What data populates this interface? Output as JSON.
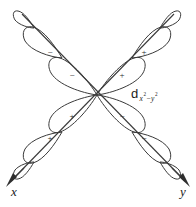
{
  "figure": {
    "type": "atomic-orbital-diagram",
    "background_color": "#ffffff",
    "stroke_color": "#3a3a3a",
    "text_color": "#1a1a1a",
    "width": 196,
    "height": 207,
    "center": {
      "x": 97,
      "y": 95
    }
  },
  "orbital_label": {
    "symbol": "d",
    "subscript_full": "x2-y2",
    "subscript_plain": "x²−y²",
    "sub_x": "x",
    "sub_exp1": "2",
    "sub_minus": "−",
    "sub_y": "y",
    "sub_exp2": "2",
    "position": {
      "x": 131,
      "y": 95
    }
  },
  "axes": [
    {
      "name": "x",
      "label": "x",
      "direction": "lower-left",
      "label_position": {
        "x": 14,
        "y": 192
      },
      "arrow_tip": {
        "x": 9,
        "y": 176
      }
    },
    {
      "name": "y",
      "label": "y",
      "direction": "lower-right",
      "label_position": {
        "x": 184,
        "y": 192
      },
      "arrow_tip": {
        "x": 188,
        "y": 176
      }
    }
  ],
  "lobes": [
    {
      "arm": "upper-left",
      "position": "inner",
      "sign": "−",
      "sign_xy": {
        "x": 72,
        "y": 76
      }
    },
    {
      "arm": "upper-left",
      "position": "outer",
      "sign": "−",
      "sign_xy": {
        "x": 50,
        "y": 53
      }
    },
    {
      "arm": "upper-left",
      "position": "tip",
      "sign": "",
      "sign_xy": null
    },
    {
      "arm": "upper-right",
      "position": "inner",
      "sign": "+",
      "sign_xy": {
        "x": 122,
        "y": 76
      }
    },
    {
      "arm": "upper-right",
      "position": "outer",
      "sign": "+",
      "sign_xy": {
        "x": 144,
        "y": 53
      }
    },
    {
      "arm": "upper-right",
      "position": "tip",
      "sign": "",
      "sign_xy": null
    },
    {
      "arm": "lower-left",
      "position": "inner",
      "sign": "+",
      "sign_xy": {
        "x": 72,
        "y": 117
      }
    },
    {
      "arm": "lower-left",
      "position": "outer",
      "sign": "+",
      "sign_xy": {
        "x": 50,
        "y": 139
      }
    },
    {
      "arm": "lower-left",
      "position": "tip",
      "sign": "",
      "sign_xy": null
    },
    {
      "arm": "lower-right",
      "position": "inner",
      "sign": "−",
      "sign_xy": {
        "x": 122,
        "y": 117
      }
    },
    {
      "arm": "lower-right",
      "position": "outer",
      "sign": "−",
      "sign_xy": {
        "x": 144,
        "y": 139
      }
    },
    {
      "arm": "lower-right",
      "position": "tip",
      "sign": "",
      "sign_xy": null
    }
  ],
  "signs": {
    "plus": "+",
    "minus": "−"
  }
}
